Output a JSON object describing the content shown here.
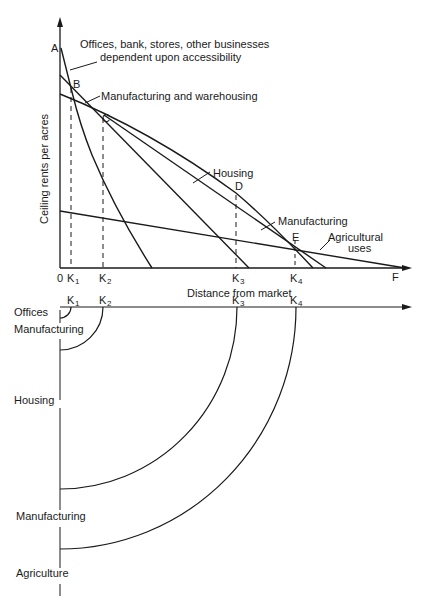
{
  "upper_diagram": {
    "y_axis_label": "Ceiling rents per acres",
    "x_axis_label": "Distance from market",
    "origin_label": "0",
    "point_labels": {
      "A": "A",
      "B": "B",
      "C": "C",
      "D": "D",
      "E": "E",
      "F": "F"
    },
    "tick_labels": {
      "k1": "K",
      "k1_sub": "1",
      "k2": "K",
      "k2_sub": "2",
      "k3": "K",
      "k3_sub": "3",
      "k4": "K",
      "k4_sub": "4"
    },
    "curve_labels": {
      "offices_line1": "Offices, bank, stores, other businesses",
      "offices_line2": "dependent upon accessibility",
      "manufacturing_warehousing": "Manufacturing and warehousing",
      "housing": "Housing",
      "manufacturing": "Manufacturing",
      "agricultural_line1": "Agricultural",
      "agricultural_line2": "uses"
    }
  },
  "lower_diagram": {
    "tick_labels": {
      "k1": "K",
      "k1_sub": "1",
      "k2": "K",
      "k2_sub": "2",
      "k3": "K",
      "k3_sub": "3",
      "k4": "K",
      "k4_sub": "4"
    },
    "zone_labels": {
      "offices": "Offices",
      "manufacturing_inner": "Manufacturing",
      "housing": "Housing",
      "manufacturing_outer": "Manufacturing",
      "agriculture": "Agriculture"
    }
  }
}
